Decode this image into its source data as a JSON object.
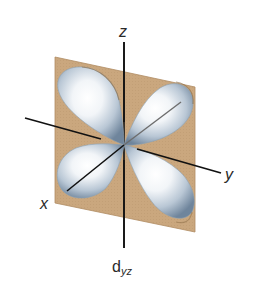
{
  "diagram": {
    "caption": {
      "main": "d",
      "subscript": "yz"
    },
    "axes": {
      "z": {
        "label": "z"
      },
      "y": {
        "label": "y"
      },
      "x": {
        "label": "x"
      }
    },
    "plane": {
      "name": "yz-plane",
      "color": "#c9a67c"
    },
    "lobes": {
      "count": 4,
      "highlight_color": "#ffffff",
      "mid_color": "#c4d0dc",
      "edge_color": "#7f95ab"
    }
  }
}
